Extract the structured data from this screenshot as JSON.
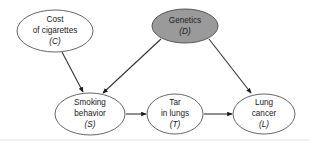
{
  "diagram": {
    "type": "causal-dag",
    "background_color": "#ffffff",
    "shaded_color": "#9a9a9a",
    "node_stroke_color": "#555555",
    "edge_color": "#333333",
    "nodes": [
      {
        "id": "C",
        "name": "cost-of-cigarettes",
        "lines": [
          "Cost",
          "of cigarettes"
        ],
        "variable": "(C)",
        "shaded": false,
        "cx": 55,
        "cy": 31,
        "rx": 38,
        "ry": 21
      },
      {
        "id": "D",
        "name": "genetics",
        "lines": [
          "Genetics"
        ],
        "variable": "(D)",
        "shaded": true,
        "cx": 185,
        "cy": 26,
        "rx": 33,
        "ry": 17
      },
      {
        "id": "S",
        "name": "smoking-behavior",
        "lines": [
          "Smoking",
          "behavior"
        ],
        "variable": "(S)",
        "shaded": false,
        "cx": 90,
        "cy": 114,
        "rx": 35,
        "ry": 21
      },
      {
        "id": "T",
        "name": "tar-in-lungs",
        "lines": [
          "Tar",
          "in lungs"
        ],
        "variable": "(T)",
        "shaded": false,
        "cx": 175,
        "cy": 114,
        "rx": 28,
        "ry": 20
      },
      {
        "id": "L",
        "name": "lung-cancer",
        "lines": [
          "Lung",
          "cancer"
        ],
        "variable": "(L)",
        "shaded": false,
        "cx": 264,
        "cy": 114,
        "rx": 31,
        "ry": 20
      }
    ],
    "edges": [
      {
        "name": "edge-cost-to-smoking",
        "from": "C",
        "to": "S",
        "x1": 62,
        "y1": 52,
        "x2": 83,
        "y2": 92
      },
      {
        "name": "edge-genetics-to-smoking",
        "from": "D",
        "to": "S",
        "x1": 161,
        "y1": 39,
        "x2": 103,
        "y2": 93
      },
      {
        "name": "edge-genetics-to-lung",
        "from": "D",
        "to": "L",
        "x1": 209,
        "y1": 39,
        "x2": 251,
        "y2": 93
      },
      {
        "name": "edge-smoking-to-tar",
        "from": "S",
        "to": "T",
        "x1": 126,
        "y1": 114,
        "x2": 146,
        "y2": 114
      },
      {
        "name": "edge-tar-to-lung",
        "from": "T",
        "to": "L",
        "x1": 204,
        "y1": 114,
        "x2": 232,
        "y2": 114
      }
    ],
    "frame": {
      "name": "bottom-frame-line",
      "y": 140
    }
  }
}
